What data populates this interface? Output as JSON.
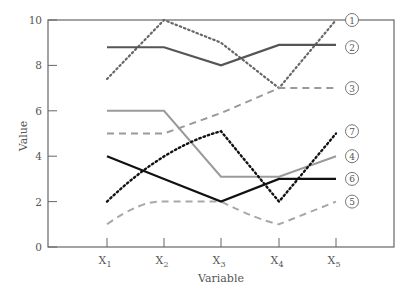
{
  "chart_data": {
    "type": "line",
    "title": "",
    "xlabel": "Variable",
    "ylabel": "Value",
    "ylim": [
      0,
      10
    ],
    "yticks": [
      0,
      2,
      4,
      6,
      8,
      10
    ],
    "categories": [
      "X1",
      "X2",
      "X3",
      "X4",
      "X5"
    ],
    "category_labels": [
      {
        "base": "X",
        "sub": "1"
      },
      {
        "base": "X",
        "sub": "2"
      },
      {
        "base": "X",
        "sub": "3"
      },
      {
        "base": "X",
        "sub": "4"
      },
      {
        "base": "X",
        "sub": "5"
      }
    ],
    "grid": false,
    "legend_position": "right-inline-labels",
    "series": [
      {
        "name": "1",
        "values": [
          7.4,
          10,
          9,
          7,
          10
        ],
        "color": "#666666",
        "style": "dotted",
        "width": 2.2
      },
      {
        "name": "2",
        "values": [
          8.8,
          8.8,
          8.0,
          8.9,
          8.9
        ],
        "color": "#555555",
        "style": "solid",
        "width": 2.2
      },
      {
        "name": "3",
        "values": [
          5,
          5,
          5.9,
          7,
          7
        ],
        "color": "#9a9a9a",
        "style": "dashed",
        "width": 2
      },
      {
        "name": "4",
        "values": [
          6,
          6,
          3.1,
          3.1,
          4
        ],
        "color": "#9a9a9a",
        "style": "solid",
        "width": 2
      },
      {
        "name": "5",
        "values": [
          1,
          2,
          2,
          1,
          2
        ],
        "color": "#a8a8a8",
        "style": "dashed",
        "width": 2
      },
      {
        "name": "6",
        "values": [
          4,
          3,
          2,
          3,
          3
        ],
        "color": "#111111",
        "style": "solid",
        "width": 2.2
      },
      {
        "name": "7",
        "values": [
          2,
          3.9,
          5.1,
          2,
          5
        ],
        "color": "#111111",
        "style": "dotted",
        "width": 2.4
      }
    ],
    "label_positions": {
      "1": 10.0,
      "2": 8.8,
      "3": 7.0,
      "7": 5.1,
      "4": 4.0,
      "6": 3.0,
      "5": 2.0
    }
  }
}
